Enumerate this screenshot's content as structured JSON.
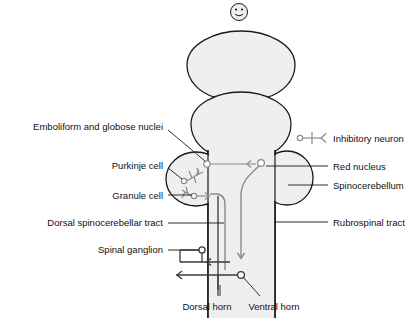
{
  "diagram": {
    "colors": {
      "outline": "#1a1a1a",
      "fill": "#efefef",
      "tract_gray": "#8a8a8a",
      "tract_dark": "#3a3a3a",
      "leader": "#1a1a1a",
      "text": "#111111",
      "background": "#ffffff"
    },
    "icons": {
      "smiley": "smiley-face-icon",
      "inhibitory_symbol": "inhibitory-neuron-symbol-icon"
    },
    "labels_left": [
      {
        "id": "emboliform-globose-nuclei",
        "text": "Emboliform and globose nuclei",
        "x": 163,
        "y": 127
      },
      {
        "id": "purkinje-cell",
        "text": "Purkinje cell",
        "x": 163,
        "y": 166
      },
      {
        "id": "granule-cell",
        "text": "Granule cell",
        "x": 163,
        "y": 198
      },
      {
        "id": "dorsal-spinocerebellar-tract",
        "text": "Dorsal spinocerebellar tract",
        "x": 163,
        "y": 226
      },
      {
        "id": "spinal-ganglion",
        "text": "Spinal ganglion",
        "x": 163,
        "y": 253
      }
    ],
    "labels_right": [
      {
        "id": "inhibitory-neuron",
        "text": "Inhibitory neuron",
        "x": 333,
        "y": 141
      },
      {
        "id": "red-nucleus",
        "text": "Red nucleus",
        "x": 333,
        "y": 169
      },
      {
        "id": "spinocerebellum",
        "text": "Spinocerebellum",
        "x": 333,
        "y": 188
      },
      {
        "id": "rubrospinal-tract",
        "text": "Rubrospinal tract",
        "x": 333,
        "y": 225
      }
    ],
    "labels_bottom": [
      {
        "id": "dorsal-horn",
        "text": "Dorsal horn",
        "x": 207,
        "y": 310
      },
      {
        "id": "ventral-horn",
        "text": "Ventral horn",
        "x": 274,
        "y": 310
      }
    ]
  }
}
